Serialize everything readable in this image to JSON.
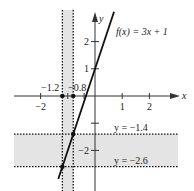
{
  "chart_data": {
    "type": "line",
    "title": "",
    "xlabel": "x",
    "ylabel": "y",
    "xlim": [
      -2.6,
      3.0
    ],
    "ylim": [
      -3.2,
      3.1
    ],
    "x_ticks": [
      -2,
      1,
      2
    ],
    "x_tick_labels": [
      "−2",
      "1",
      "2"
    ],
    "y_ticks": [
      2,
      1,
      -1,
      -2
    ],
    "y_tick_labels": [
      "2",
      "1",
      "",
      "−2"
    ],
    "series": [
      {
        "name": "f(x) = 3x + 1",
        "slope": 3,
        "intercept": 1,
        "x_range": [
          -1.35,
          0.7
        ]
      }
    ],
    "function_label": "f(x) = 3x + 1",
    "vertical_band": {
      "x_min": -1.2,
      "x_max": -0.8,
      "labels": [
        "−1.2",
        "−0.8"
      ]
    },
    "horizontal_band": {
      "y_min": -2.6,
      "y_max": -1.4,
      "labels": [
        "y = −1.4",
        "y = −2.6"
      ]
    },
    "points": [
      {
        "x": -1.2,
        "y": 0
      },
      {
        "x": -0.8,
        "y": 0
      },
      {
        "x": -0.8,
        "y": -1.4
      },
      {
        "x": -1.2,
        "y": -2.6
      }
    ],
    "grid": false,
    "legend": "none"
  }
}
